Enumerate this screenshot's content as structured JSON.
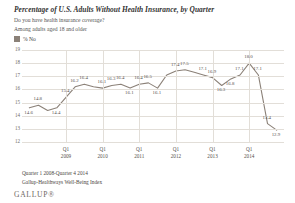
{
  "header": {
    "title": "Percentage of U.S. Adults Without Health Insurance, by Quarter",
    "subtitle1": "Do you have health insurance coverage?",
    "subtitle2": "Among adults aged 18 and older"
  },
  "legend": {
    "label": "% No",
    "color": "#8b8178"
  },
  "footer": {
    "line1": "Quarter 1 2008-Quarter 4 2014",
    "line2": "Gallup-Healthways Well-Being Index",
    "brand": "GALLUP®"
  },
  "chart_data": {
    "type": "line",
    "title": "Percentage of U.S. Adults Without Health Insurance, by Quarter",
    "xlabel": "",
    "ylabel": "",
    "ylim": [
      12,
      19
    ],
    "yticks": [
      "19",
      "18",
      "17",
      "16",
      "15",
      "14",
      "13",
      "12"
    ],
    "grid": true,
    "legend_position": "top-left",
    "xtick_labels": [
      {
        "q": "Q1",
        "yr": "2009"
      },
      {
        "q": "Q1",
        "yr": "2010"
      },
      {
        "q": "Q1",
        "yr": "2011"
      },
      {
        "q": "Q1",
        "yr": "2012"
      },
      {
        "q": "Q1",
        "yr": "2013"
      },
      {
        "q": "Q1",
        "yr": "2014"
      }
    ],
    "series": [
      {
        "name": "% No",
        "color": "#8b8178",
        "values": [
          14.6,
          14.8,
          14.4,
          14.6,
          15.4,
          16.2,
          16.4,
          16.2,
          16.1,
          16.3,
          16.4,
          16.1,
          16.4,
          16.5,
          16.1,
          17.1,
          17.4,
          17.5,
          17.3,
          17.1,
          16.9,
          16.3,
          16.8,
          17.1,
          18.0,
          17.1,
          13.4,
          12.9
        ]
      }
    ],
    "point_labels": [
      {
        "i": 0,
        "text": "14.6",
        "pos": "below"
      },
      {
        "i": 1,
        "text": "14.8",
        "pos": "above"
      },
      {
        "i": 4,
        "text": "15.4",
        "pos": "above"
      },
      {
        "i": 3,
        "text": "14.4",
        "pos": "below"
      },
      {
        "i": 5,
        "text": "16.2",
        "pos": "above"
      },
      {
        "i": 6,
        "text": "16.4",
        "pos": "above"
      },
      {
        "i": 8,
        "text": "16.1",
        "pos": "above"
      },
      {
        "i": 9,
        "text": "16.3",
        "pos": "above"
      },
      {
        "i": 10,
        "text": "16.4",
        "pos": "above"
      },
      {
        "i": 11,
        "text": "16.1",
        "pos": "below"
      },
      {
        "i": 12,
        "text": "16.4",
        "pos": "above"
      },
      {
        "i": 13,
        "text": "16.5",
        "pos": "above"
      },
      {
        "i": 14,
        "text": "16.1",
        "pos": "below"
      },
      {
        "i": 16,
        "text": "17.4",
        "pos": "above"
      },
      {
        "i": 17,
        "text": "17.5",
        "pos": "above"
      },
      {
        "i": 19,
        "text": "17.1",
        "pos": "above"
      },
      {
        "i": 20,
        "text": "16.9",
        "pos": "above"
      },
      {
        "i": 21,
        "text": "16.3",
        "pos": "below"
      },
      {
        "i": 22,
        "text": "16.8",
        "pos": "below"
      },
      {
        "i": 23,
        "text": "17.1",
        "pos": "above"
      },
      {
        "i": 24,
        "text": "18.0",
        "pos": "above"
      },
      {
        "i": 25,
        "text": "17.1",
        "pos": "above"
      },
      {
        "i": 26,
        "text": "13.4",
        "pos": "above"
      },
      {
        "i": 27,
        "text": "12.9",
        "pos": "below"
      }
    ]
  }
}
